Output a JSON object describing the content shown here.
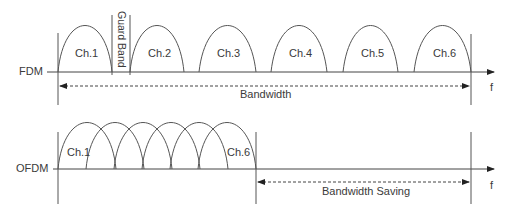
{
  "fdm": {
    "label": "FDM",
    "channels": [
      "Ch.1",
      "Ch.2",
      "Ch.3",
      "Ch.4",
      "Ch.5",
      "Ch.6"
    ],
    "guard_band_label": "Guard Band",
    "bandwidth_label": "Bandwidth",
    "axis_label": "f"
  },
  "ofdm": {
    "label": "OFDM",
    "first_channel": "Ch.1",
    "last_channel": "Ch.6",
    "bandwidth_saving_label": "Bandwidth Saving",
    "axis_label": "f"
  },
  "colors": {
    "line": "#555555",
    "text": "#3a3a3a"
  }
}
